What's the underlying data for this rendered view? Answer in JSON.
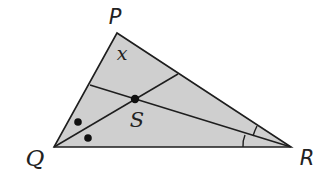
{
  "diagram": {
    "type": "triangle-angle-bisectors",
    "fill_color": "#cfcfcf",
    "stroke_color": "#1e1e1e",
    "vertices": {
      "P": {
        "label": "P",
        "x": 117,
        "y": 33
      },
      "Q": {
        "label": "Q",
        "x": 54,
        "y": 147
      },
      "R": {
        "label": "R",
        "x": 291,
        "y": 147
      }
    },
    "incenter": {
      "label": "S",
      "x": 135,
      "y": 99
    },
    "angle_label": {
      "text": "x",
      "at_vertex": "P"
    },
    "bisectors": [
      {
        "from": "Q",
        "to_side": "PR",
        "end": {
          "x": 178,
          "y": 74
        }
      },
      {
        "from": "R",
        "to_side": "PQ",
        "end": {
          "x": 90,
          "y": 85
        }
      }
    ],
    "angle_marks": [
      {
        "vertex": "Q",
        "type": "dot",
        "count": 2,
        "meaning": "congruent halves of angle Q"
      },
      {
        "vertex": "R",
        "type": "arc",
        "count": 2,
        "meaning": "congruent halves of angle R"
      }
    ],
    "labels": {
      "P": "P",
      "Q": "Q",
      "R": "R",
      "S": "S",
      "x": "x"
    }
  }
}
